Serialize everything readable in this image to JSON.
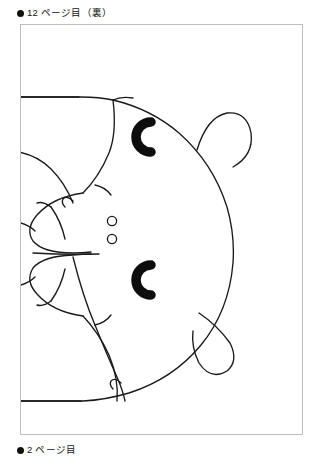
{
  "page": {
    "background_color": "#ffffff",
    "width": 321,
    "height": 463
  },
  "captions": {
    "top": {
      "bullet": "bullet-marker",
      "text": "12 ページ目（裏）"
    },
    "bottom": {
      "bullet": "bullet-marker",
      "text": "2 ページ目"
    }
  },
  "frame": {
    "border_color": "#bdbdbd",
    "fill_color": "#ffffff"
  },
  "artwork": {
    "title": "bear-face-line-drawing-rotated",
    "orientation": "rotated-90-ccw",
    "line_color": "#1a1a1a",
    "fill_color": "#ffffff",
    "features": [
      "head-outline",
      "ear-top-right",
      "ear-bottom-right",
      "eye-upper",
      "eye-lower",
      "nostril-upper",
      "nostril-lower",
      "snout-muzzle",
      "mouth",
      "body-edge-left"
    ]
  }
}
